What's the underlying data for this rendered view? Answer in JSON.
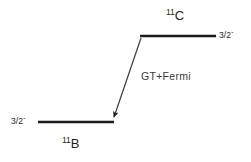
{
  "diagram": {
    "type": "nuclear-energy-level-decay-diagram",
    "background_color": "#ffffff",
    "line_color": "#1a1a1a",
    "text_color": "#231f20",
    "upper_level": {
      "nuclide_mass_number": "11",
      "nuclide_symbol": "C",
      "spin_parity_value": "3/2",
      "spin_parity_sign": "-",
      "line_x1": 140,
      "line_x2": 216,
      "line_y": 36
    },
    "lower_level": {
      "nuclide_mass_number": "11",
      "nuclide_symbol": "B",
      "spin_parity_value": "3/2",
      "spin_parity_sign": "-",
      "line_x1": 38,
      "line_x2": 114,
      "line_y": 122
    },
    "transition": {
      "label": "GT+Fermi",
      "from_x": 141,
      "from_y": 38,
      "to_x": 113,
      "to_y": 120
    }
  }
}
